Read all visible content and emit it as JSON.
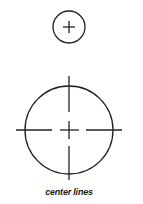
{
  "figure": {
    "caption": "center lines",
    "stroke_color": "#222222",
    "small_circle": {
      "cx": 69,
      "cy": 27,
      "r": 16
    },
    "large_circle": {
      "cx": 69,
      "cy": 130,
      "r": 44
    }
  }
}
